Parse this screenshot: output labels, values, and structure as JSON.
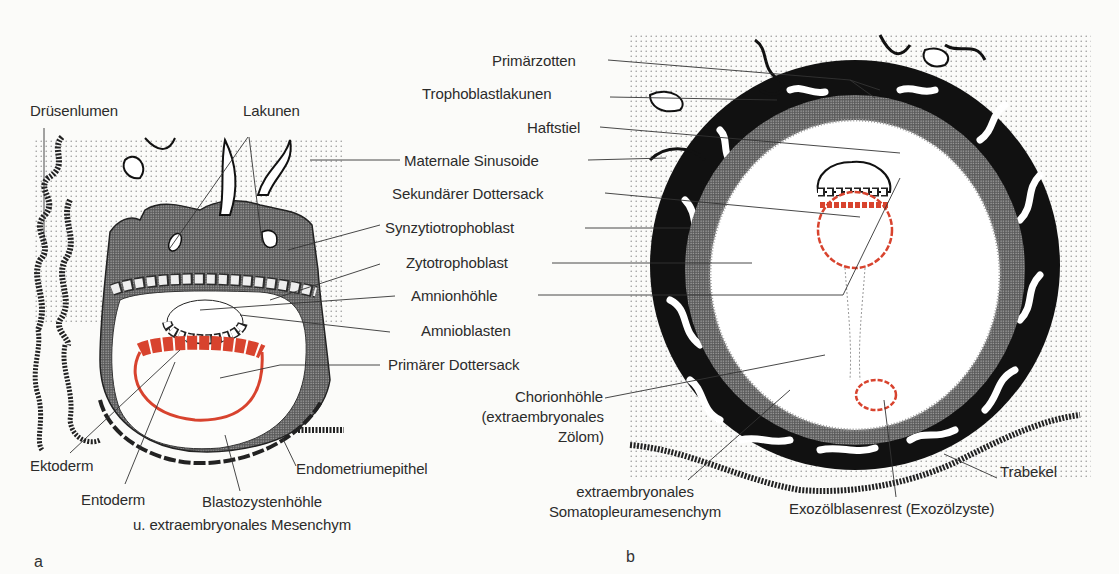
{
  "colors": {
    "endoderm_red": "#d8432e",
    "trophoblast_black": "#111111",
    "stipple": "#9a9a9a",
    "background": "#fbfbf9"
  },
  "panel_a": {
    "letter": "a",
    "labels": {
      "druesenlumen": "Drüsenlumen",
      "lakunen": "Lakunen",
      "ektoderm": "Ektoderm",
      "entoderm": "Entoderm",
      "blastozystenhoehle_1": "Blastozystenhöhle",
      "blastozystenhoehle_2": "u. extraembryonales Mesenchym",
      "endometriumepithel": "Endometriumepithel"
    }
  },
  "shared_labels": {
    "maternale_sinusoide": "Maternale Sinusoide",
    "synzytiotrophoblast": "Synzytiotrophoblast",
    "zytotrophoblast": "Zytotrophoblast",
    "amnionhoehle": "Amnionhöhle",
    "amnioblasten": "Amnioblasten",
    "primaerer_dottersack": "Primärer Dottersack"
  },
  "panel_b": {
    "letter": "b",
    "labels": {
      "primaerzotten": "Primärzotten",
      "trophoblastlakunen": "Trophoblastlakunen",
      "haftstiel": "Haftstiel",
      "sekundaerer_dottersack": "Sekundärer Dottersack",
      "chorionhoehle_1": "Chorionhöhle",
      "chorionhoehle_2": "(extraembryonales",
      "chorionhoehle_3": "Zölom)",
      "somatopleura_1": "extraembryonales",
      "somatopleura_2": "Somatopleuramesenchym",
      "exozoel": "Exozölblasenrest (Exozölzyste)",
      "trabekel": "Trabekel"
    }
  }
}
